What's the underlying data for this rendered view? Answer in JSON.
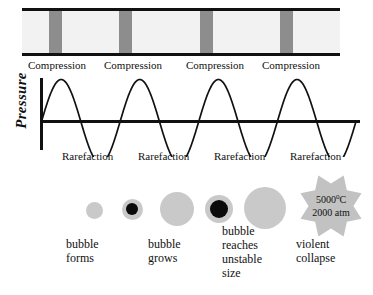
{
  "figure": {
    "colors": {
      "band_fill": "#8d8d8d",
      "band_background": "#f2f2f2",
      "bubble_gray": "#c9c9c9",
      "bubble_core": "#0b0b0b",
      "burst_gray": "#c2c2c2",
      "ink": "#111111"
    }
  },
  "wave_band": {
    "name": "sound-wave-band",
    "compression_bands": [
      {
        "left_pct": 8.5,
        "width_pct": 4.1
      },
      {
        "left_pct": 30.5,
        "width_pct": 4.1
      },
      {
        "left_pct": 56.0,
        "width_pct": 4.1
      },
      {
        "left_pct": 81.0,
        "width_pct": 4.1
      }
    ]
  },
  "labels": {
    "compression": [
      "Compression",
      "Compression",
      "Compression",
      "Compression"
    ],
    "rarefaction": [
      "Rarefaction",
      "Rarefaction",
      "Rarefaction",
      "Rarefaction"
    ],
    "compression_x": [
      28,
      104,
      186,
      262
    ],
    "rarefaction_x": [
      62,
      138,
      214,
      290
    ],
    "y_axis_label": "Pressure"
  },
  "chart_data": {
    "type": "line",
    "title": "",
    "xlabel": "",
    "ylabel": "Pressure",
    "grid": false,
    "legend": null,
    "ylim": [
      -1,
      1
    ],
    "xlim": [
      0,
      4
    ],
    "series": [
      {
        "name": "acoustic pressure wave",
        "description": "sinusoidal acoustic pressure, 4 full cycles, amplitude 1, starting at zero going positive",
        "cycles": 4,
        "amplitude": 1,
        "phase": 0,
        "x": [
          0,
          0.25,
          0.5,
          0.75,
          1,
          1.25,
          1.5,
          1.75,
          2,
          2.25,
          2.5,
          2.75,
          3,
          3.25,
          3.5,
          3.75,
          4
        ],
        "y": [
          0,
          1,
          0,
          -1,
          0,
          1,
          0,
          -1,
          0,
          1,
          0,
          -1,
          0,
          1,
          0,
          -1,
          0
        ]
      }
    ],
    "annotations": [
      {
        "text": "Compression",
        "at_y": 1
      },
      {
        "text": "Rarefaction",
        "at_y": -1
      }
    ]
  },
  "bubbles": [
    {
      "name": "bubble-1",
      "cx": 94,
      "r": 8.5,
      "core_r": 0
    },
    {
      "name": "bubble-2",
      "cx": 132,
      "r": 10.5,
      "core_r": 6
    },
    {
      "name": "bubble-3",
      "cx": 177,
      "r": 17,
      "core_r": 0
    },
    {
      "name": "bubble-4",
      "cx": 219,
      "r": 14,
      "core_r": 9
    },
    {
      "name": "bubble-5",
      "cx": 265,
      "r": 21,
      "core_r": 0
    }
  ],
  "burst": {
    "name": "collapse-starburst",
    "temperature": "5000",
    "temperature_unit": "0C",
    "temperature_text": "5000 C",
    "pressure_text": "2000 atm",
    "points": 8
  },
  "captions": [
    {
      "name": "caption-bubble-forms",
      "lines": [
        "bubble",
        "forms"
      ],
      "x": 66,
      "y": 237
    },
    {
      "name": "caption-bubble-grows",
      "lines": [
        "bubble",
        "grows"
      ],
      "x": 148,
      "y": 237
    },
    {
      "name": "caption-unstable-size",
      "lines": [
        "bubble",
        "reaches",
        "unstable",
        "size"
      ],
      "x": 222,
      "y": 224
    },
    {
      "name": "caption-violent-collapse",
      "lines": [
        "violent",
        "collapse"
      ],
      "x": 296,
      "y": 237
    }
  ]
}
